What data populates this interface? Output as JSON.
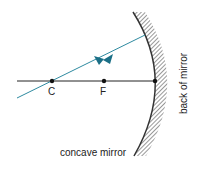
{
  "diagram": {
    "points": [
      {
        "id": "C",
        "label": "C",
        "x": 52,
        "y": 81
      },
      {
        "id": "F",
        "label": "F",
        "x": 104,
        "y": 81
      },
      {
        "id": "V",
        "label": "",
        "x": 155,
        "y": 81
      }
    ],
    "labels": {
      "mirror": "concave mirror",
      "back": "back of mirror"
    },
    "colors": {
      "ray": "#2e8aa0",
      "arrow": "#1b6f86",
      "axis": "#222222",
      "mirror": "#333333"
    }
  }
}
